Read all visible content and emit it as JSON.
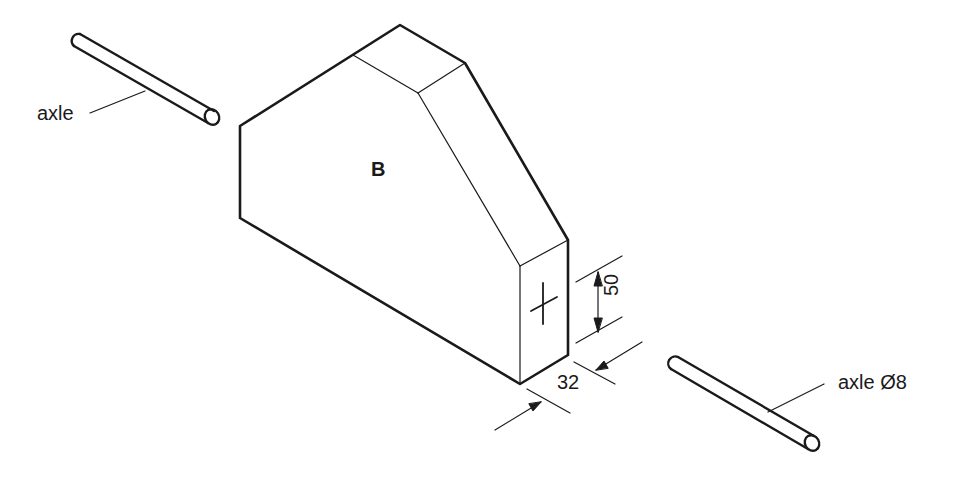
{
  "diagram": {
    "type": "isometric technical drawing",
    "part_label": "B",
    "labels": {
      "axle_left": "axle",
      "axle_right": "axle Ø8"
    },
    "dimensions": {
      "height": "50",
      "thickness": "32"
    },
    "colors": {
      "line": "#1a1a1a",
      "background": "#ffffff"
    }
  }
}
